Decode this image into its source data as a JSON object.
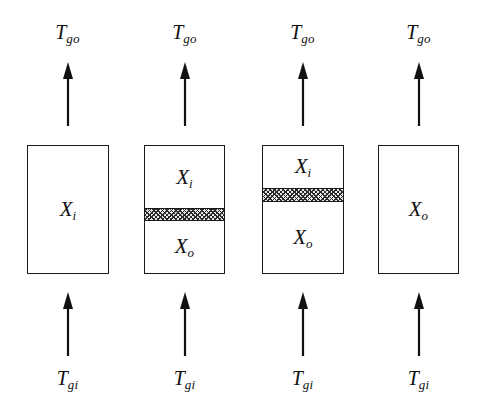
{
  "figure": {
    "background_color": "#ffffff",
    "line_color": "#1a1a1a",
    "hatch_color": "#2b2b2b",
    "hatch_fill_color": "#e8e8e8"
  },
  "labels": {
    "gas_out": {
      "base": "T",
      "sub": "go"
    },
    "gas_in": {
      "base": "T",
      "sub": "gi"
    },
    "unreacted": {
      "base": "X",
      "sub": "i"
    },
    "reacted": {
      "base": "X",
      "sub": "o"
    }
  },
  "stages": [
    {
      "name": "stage-1",
      "left": 8,
      "width": 119,
      "box_left": 19,
      "box_width": 82,
      "top_label": {
        "base": "T",
        "sub": "go"
      },
      "bottom_label": {
        "base": "T",
        "sub": "gi"
      },
      "arrow_out": "arrow-up",
      "arrow_in": "arrow-up",
      "front_position_pct": null,
      "regions": [
        {
          "name": "region-unreacted",
          "base": "X",
          "sub": "i",
          "top_pct": 0,
          "height_pct": 100
        }
      ]
    },
    {
      "name": "stage-2",
      "left": 125,
      "width": 119,
      "box_left": 19,
      "box_width": 81,
      "top_label": {
        "base": "T",
        "sub": "go"
      },
      "bottom_label": {
        "base": "T",
        "sub": "gi"
      },
      "arrow_out": "arrow-up",
      "arrow_in": "arrow-up",
      "front_position_pct": 49,
      "regions": [
        {
          "name": "region-unreacted",
          "base": "X",
          "sub": "i",
          "top_pct": 0,
          "height_pct": 49
        },
        {
          "name": "region-reacted",
          "base": "X",
          "sub": "o",
          "top_pct": 59,
          "height_pct": 41
        }
      ]
    },
    {
      "name": "stage-3",
      "left": 243,
      "width": 119,
      "box_left": 19,
      "box_width": 82,
      "top_label": {
        "base": "T",
        "sub": "go"
      },
      "bottom_label": {
        "base": "T",
        "sub": "gi"
      },
      "arrow_out": "arrow-up",
      "arrow_in": "arrow-up",
      "front_position_pct": 33,
      "regions": [
        {
          "name": "region-unreacted",
          "base": "X",
          "sub": "i",
          "top_pct": 0,
          "height_pct": 33
        },
        {
          "name": "region-reacted",
          "base": "X",
          "sub": "o",
          "top_pct": 44,
          "height_pct": 56
        }
      ]
    },
    {
      "name": "stage-4",
      "left": 359,
      "width": 119,
      "box_left": 19,
      "box_width": 81,
      "top_label": {
        "base": "T",
        "sub": "go"
      },
      "bottom_label": {
        "base": "T",
        "sub": "gi"
      },
      "arrow_out": "arrow-up",
      "arrow_in": "arrow-up",
      "front_position_pct": null,
      "regions": [
        {
          "name": "region-reacted",
          "base": "X",
          "sub": "o",
          "top_pct": 0,
          "height_pct": 100
        }
      ]
    }
  ]
}
